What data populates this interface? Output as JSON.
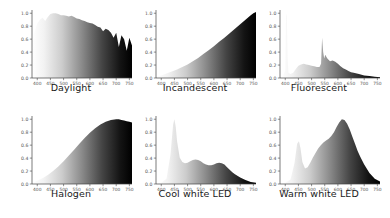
{
  "figure": {
    "background_color": "#ffffff",
    "grid_rows": 2,
    "grid_cols": 3,
    "axis_color": "#444444",
    "tick_label_color": "#555555",
    "title_color": "#1a1a1a",
    "fill_gradient_start": "#ffffff",
    "fill_gradient_end": "#000000"
  },
  "chart_data": [
    {
      "type": "area",
      "title": "Daylight",
      "xlabel": "",
      "ylabel": "",
      "xlim": [
        380,
        760
      ],
      "ylim": [
        0.0,
        1.05
      ],
      "grid": false,
      "legend": "none",
      "xticks": [
        400,
        450,
        500,
        550,
        600,
        650,
        700,
        750
      ],
      "xticklabels": [
        "400",
        "450",
        "500",
        "550",
        "600",
        "650",
        "700",
        "750"
      ],
      "yticks": [
        0.0,
        0.2,
        0.4,
        0.6,
        0.8,
        1.0
      ],
      "yticklabels": [
        "0.0",
        "0.2",
        "0.4",
        "0.6",
        "0.8",
        "1.0"
      ],
      "x": [
        380,
        390,
        400,
        410,
        420,
        430,
        440,
        450,
        460,
        470,
        480,
        490,
        500,
        510,
        520,
        530,
        540,
        550,
        560,
        570,
        580,
        590,
        600,
        610,
        620,
        630,
        640,
        650,
        660,
        670,
        680,
        690,
        700,
        710,
        720,
        730,
        740,
        750,
        760
      ],
      "y": [
        0.6,
        0.72,
        0.84,
        0.9,
        0.93,
        0.88,
        0.94,
        0.99,
        1.0,
        1.0,
        0.99,
        0.97,
        0.97,
        0.96,
        0.95,
        0.96,
        0.94,
        0.92,
        0.91,
        0.89,
        0.88,
        0.86,
        0.85,
        0.84,
        0.82,
        0.79,
        0.78,
        0.72,
        0.76,
        0.74,
        0.7,
        0.62,
        0.7,
        0.48,
        0.66,
        0.6,
        0.42,
        0.62,
        0.5
      ]
    },
    {
      "type": "area",
      "title": "Incandescent",
      "xlabel": "",
      "ylabel": "",
      "xlim": [
        380,
        760
      ],
      "ylim": [
        0.0,
        1.05
      ],
      "grid": false,
      "legend": "none",
      "xticks": [
        400,
        450,
        500,
        550,
        600,
        650,
        700,
        750
      ],
      "xticklabels": [
        "400",
        "450",
        "500",
        "550",
        "600",
        "650",
        "700",
        "750"
      ],
      "yticks": [
        0.0,
        0.2,
        0.4,
        0.6,
        0.8,
        1.0
      ],
      "yticklabels": [
        "0.0",
        "0.2",
        "0.4",
        "0.6",
        "0.8",
        "1.0"
      ],
      "x": [
        380,
        400,
        420,
        440,
        460,
        480,
        500,
        520,
        540,
        560,
        580,
        600,
        620,
        640,
        660,
        680,
        700,
        720,
        740,
        750,
        760
      ],
      "y": [
        0.02,
        0.04,
        0.07,
        0.1,
        0.13,
        0.17,
        0.21,
        0.26,
        0.31,
        0.37,
        0.43,
        0.49,
        0.56,
        0.62,
        0.69,
        0.76,
        0.83,
        0.9,
        0.97,
        1.0,
        1.02
      ]
    },
    {
      "type": "area",
      "title": "Fluorescent",
      "xlabel": "",
      "ylabel": "",
      "xlim": [
        380,
        760
      ],
      "ylim": [
        0.0,
        1.05
      ],
      "grid": false,
      "legend": "none",
      "xticks": [
        400,
        450,
        500,
        550,
        600,
        650,
        700,
        750
      ],
      "xticklabels": [
        "400",
        "450",
        "500",
        "550",
        "600",
        "650",
        "700",
        "750"
      ],
      "yticks": [
        0.0,
        0.2,
        0.4,
        0.6,
        0.8,
        1.0
      ],
      "yticklabels": [
        "0.0",
        "0.2",
        "0.4",
        "0.6",
        "0.8",
        "1.0"
      ],
      "x": [
        380,
        390,
        400,
        403,
        406,
        409,
        412,
        420,
        430,
        440,
        450,
        460,
        470,
        480,
        490,
        500,
        510,
        520,
        530,
        536,
        540,
        544,
        548,
        552,
        556,
        560,
        570,
        580,
        590,
        600,
        610,
        620,
        630,
        640,
        650,
        660,
        680,
        700,
        720,
        740,
        760
      ],
      "y": [
        0.01,
        0.02,
        0.12,
        1.0,
        0.95,
        0.3,
        0.08,
        0.06,
        0.08,
        0.14,
        0.19,
        0.21,
        0.22,
        0.21,
        0.2,
        0.19,
        0.18,
        0.17,
        0.17,
        0.22,
        0.62,
        0.4,
        0.3,
        0.36,
        0.33,
        0.3,
        0.26,
        0.27,
        0.25,
        0.22,
        0.18,
        0.15,
        0.13,
        0.11,
        0.09,
        0.08,
        0.06,
        0.04,
        0.03,
        0.02,
        0.01
      ]
    },
    {
      "type": "area",
      "title": "Halogen",
      "xlabel": "",
      "ylabel": "",
      "xlim": [
        380,
        760
      ],
      "ylim": [
        0.0,
        1.05
      ],
      "grid": false,
      "legend": "none",
      "xticks": [
        400,
        450,
        500,
        550,
        600,
        650,
        700,
        750
      ],
      "xticklabels": [
        "400",
        "450",
        "500",
        "550",
        "600",
        "650",
        "700",
        "750"
      ],
      "yticks": [
        0.0,
        0.2,
        0.4,
        0.6,
        0.8,
        1.0
      ],
      "yticklabels": [
        "0.0",
        "0.2",
        "0.4",
        "0.6",
        "0.8",
        "1.0"
      ],
      "x": [
        380,
        400,
        420,
        440,
        460,
        480,
        500,
        520,
        540,
        560,
        580,
        600,
        620,
        640,
        660,
        680,
        700,
        710,
        720,
        730,
        740,
        750,
        760
      ],
      "y": [
        0.02,
        0.05,
        0.09,
        0.14,
        0.2,
        0.27,
        0.35,
        0.44,
        0.53,
        0.62,
        0.71,
        0.79,
        0.86,
        0.92,
        0.96,
        0.99,
        1.0,
        1.0,
        0.99,
        0.98,
        0.97,
        0.96,
        0.95
      ]
    },
    {
      "type": "area",
      "title": "Cool white LED",
      "xlabel": "",
      "ylabel": "",
      "xlim": [
        380,
        760
      ],
      "ylim": [
        0.0,
        1.05
      ],
      "grid": false,
      "legend": "none",
      "xticks": [
        400,
        450,
        500,
        550,
        600,
        650,
        700,
        750
      ],
      "xticklabels": [
        "400",
        "450",
        "500",
        "550",
        "600",
        "650",
        "700",
        "750"
      ],
      "yticks": [
        0.0,
        0.2,
        0.4,
        0.6,
        0.8,
        1.0
      ],
      "yticklabels": [
        "0.0",
        "0.2",
        "0.4",
        "0.6",
        "0.8",
        "1.0"
      ],
      "x": [
        380,
        400,
        420,
        435,
        445,
        450,
        455,
        460,
        470,
        480,
        490,
        500,
        510,
        520,
        530,
        540,
        550,
        560,
        570,
        580,
        590,
        600,
        610,
        620,
        630,
        640,
        650,
        660,
        670,
        680,
        700,
        720,
        740,
        760
      ],
      "y": [
        0.01,
        0.02,
        0.08,
        0.45,
        0.92,
        1.0,
        0.88,
        0.66,
        0.41,
        0.34,
        0.32,
        0.33,
        0.35,
        0.37,
        0.38,
        0.37,
        0.35,
        0.32,
        0.3,
        0.29,
        0.29,
        0.3,
        0.32,
        0.33,
        0.32,
        0.3,
        0.26,
        0.22,
        0.18,
        0.15,
        0.1,
        0.06,
        0.03,
        0.02
      ]
    },
    {
      "type": "area",
      "title": "Warm white LED",
      "xlabel": "",
      "ylabel": "",
      "xlim": [
        380,
        760
      ],
      "ylim": [
        0.0,
        1.05
      ],
      "grid": false,
      "legend": "none",
      "xticks": [
        400,
        450,
        500,
        550,
        600,
        650,
        700,
        750
      ],
      "xticklabels": [
        "400",
        "450",
        "500",
        "550",
        "600",
        "650",
        "700",
        "750"
      ],
      "yticks": [
        0.0,
        0.2,
        0.4,
        0.6,
        0.8,
        1.0
      ],
      "yticklabels": [
        "0.0",
        "0.2",
        "0.4",
        "0.6",
        "0.8",
        "1.0"
      ],
      "x": [
        380,
        400,
        420,
        435,
        445,
        452,
        458,
        465,
        475,
        485,
        495,
        505,
        515,
        525,
        535,
        545,
        555,
        565,
        575,
        585,
        595,
        605,
        615,
        625,
        635,
        645,
        655,
        665,
        675,
        685,
        700,
        720,
        740,
        760
      ],
      "y": [
        0.01,
        0.02,
        0.07,
        0.32,
        0.62,
        0.66,
        0.55,
        0.34,
        0.24,
        0.26,
        0.33,
        0.41,
        0.48,
        0.55,
        0.6,
        0.64,
        0.67,
        0.7,
        0.74,
        0.8,
        0.88,
        0.95,
        1.0,
        0.99,
        0.93,
        0.84,
        0.73,
        0.62,
        0.51,
        0.42,
        0.3,
        0.17,
        0.08,
        0.04
      ]
    }
  ]
}
